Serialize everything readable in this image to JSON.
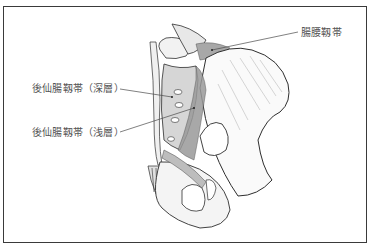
{
  "figure": {
    "labels": {
      "iliolumbar": "腸腰靱帯",
      "posterior_sacroiliac_deep": "後仙腸靱帯（深層）",
      "posterior_sacroiliac_superficial": "後仙腸靱帯（浅層）"
    },
    "colors": {
      "border": "#3a3a3a",
      "line": "#4a4a4a",
      "ligament_shade": "#9a9a9a",
      "bone_outline": "#2e2e2e",
      "label_text": "#555555"
    }
  }
}
